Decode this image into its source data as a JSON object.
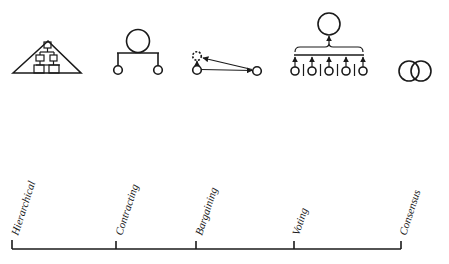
{
  "diagram": {
    "type": "coordination-mechanisms-spectrum",
    "colors": {
      "ink": "#1a1a1a",
      "background": "#ffffff"
    },
    "axis": {
      "ticks": [
        {
          "label": "Hierarchical",
          "x": 12
        },
        {
          "label": "Contracting",
          "x": 116
        },
        {
          "label": "Bargaining",
          "x": 196
        },
        {
          "label": "Voting",
          "x": 294
        },
        {
          "label": "Consensus",
          "x": 401
        }
      ]
    },
    "icons": [
      {
        "name": "hierarchical-icon",
        "depicts": "triangle containing organizational tree chart"
      },
      {
        "name": "contracting-icon",
        "depicts": "large circle connected by bar to two small circles"
      },
      {
        "name": "bargaining-icon",
        "depicts": "two small circles with arrows between them and dashed circle"
      },
      {
        "name": "voting-icon",
        "depicts": "five small circles with arrows to a bracket pointing to large circle"
      },
      {
        "name": "consensus-icon",
        "depicts": "two overlapping circles"
      }
    ]
  }
}
